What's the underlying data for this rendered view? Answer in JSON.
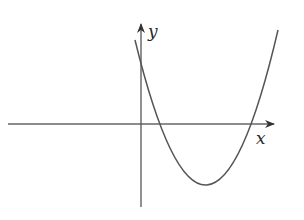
{
  "diagram": {
    "type": "function-graph",
    "axes": {
      "x_label": "x",
      "y_label": "y",
      "color": "#555555"
    },
    "curve": {
      "kind": "parabola",
      "opens": "up",
      "color": "#555555",
      "features": {
        "y_intercept": "positive",
        "roots": "two positive roots",
        "vertex": "fourth quadrant"
      }
    }
  }
}
